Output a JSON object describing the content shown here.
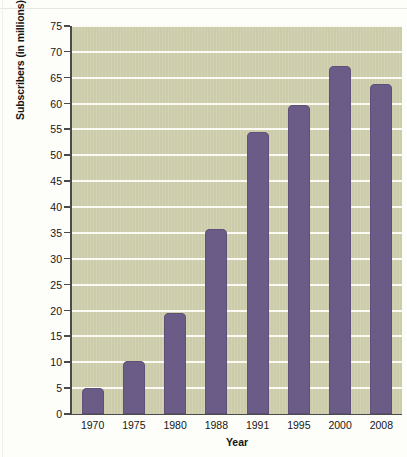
{
  "chart_data": {
    "type": "bar",
    "title": "",
    "xlabel": "Year",
    "ylabel": "Subscribers (in millions)",
    "categories": [
      "1970",
      "1975",
      "1980",
      "1988",
      "1991",
      "1995",
      "2000",
      "2008"
    ],
    "values": [
      5.1,
      10.2,
      19.5,
      35.7,
      54.5,
      59.8,
      67.3,
      63.7
    ],
    "ylim": [
      0,
      75
    ],
    "ytick_step": 5,
    "ytick_labels": [
      "75",
      "70",
      "65",
      "60",
      "55",
      "50",
      "45",
      "40",
      "35",
      "30",
      "25",
      "20",
      "15",
      "10",
      "5",
      "0"
    ],
    "grid": true,
    "legend": false,
    "bar_color": "#6b5b87",
    "plot_background": "#ccccab",
    "gridline_color": "#fbfbf3",
    "axis_color": "#4a4a4a"
  }
}
